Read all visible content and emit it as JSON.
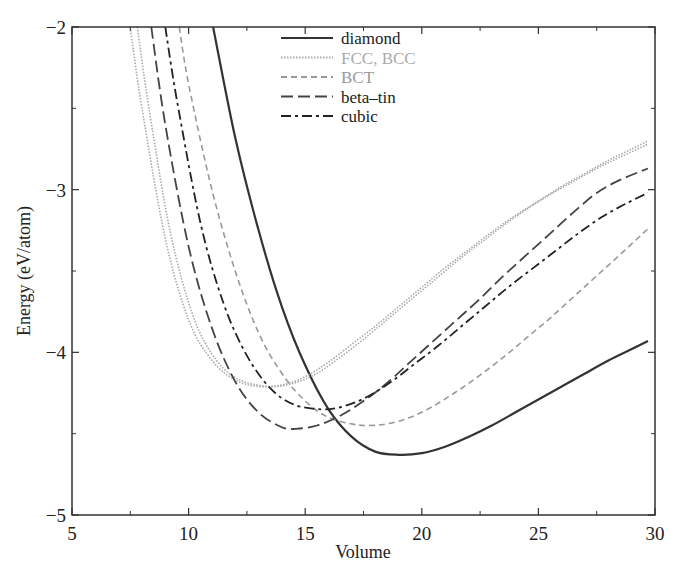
{
  "chart_data": {
    "type": "line",
    "title": "",
    "xlabel": "Volume",
    "ylabel": "Energy  (eV/atom)",
    "xlim": [
      5,
      30
    ],
    "ylim": [
      -5,
      -2
    ],
    "xticks": [
      5,
      10,
      15,
      20,
      25,
      30
    ],
    "yticks": [
      -5,
      -4,
      -3,
      -2
    ],
    "xtick_labels": [
      "5",
      "10",
      "15",
      "20",
      "25",
      "30"
    ],
    "ytick_labels": [
      "−5",
      "−4",
      "−3",
      "−2"
    ],
    "grid": false,
    "legend_position": "upper-center",
    "series": [
      {
        "name": "diamond",
        "legend_label": "diamond",
        "color": "#333333",
        "dash": "solid",
        "width": 2.2,
        "x": [
          11.05,
          12,
          13,
          14,
          15,
          16,
          17,
          18,
          19,
          20,
          21,
          22,
          23,
          24,
          25,
          26,
          27,
          28,
          29,
          29.7
        ],
        "y": [
          -2.0,
          -2.68,
          -3.25,
          -3.72,
          -4.08,
          -4.35,
          -4.52,
          -4.61,
          -4.63,
          -4.62,
          -4.58,
          -4.52,
          -4.45,
          -4.37,
          -4.29,
          -4.21,
          -4.13,
          -4.05,
          -3.98,
          -3.93
        ]
      },
      {
        "name": "FCC",
        "legend_label": "FCC, BCC",
        "color": "#aaaaaa",
        "dash": "dotted",
        "width": 1.6,
        "x": [
          7.5,
          8,
          9,
          10,
          11,
          12,
          13,
          14,
          15,
          16,
          17,
          18,
          19,
          20,
          21,
          22,
          23,
          24,
          25,
          26,
          27,
          28,
          29,
          29.7
        ],
        "y": [
          -2.0,
          -2.5,
          -3.3,
          -3.8,
          -4.05,
          -4.17,
          -4.21,
          -4.2,
          -4.15,
          -4.06,
          -3.95,
          -3.84,
          -3.72,
          -3.6,
          -3.48,
          -3.37,
          -3.26,
          -3.16,
          -3.07,
          -2.98,
          -2.9,
          -2.82,
          -2.75,
          -2.7
        ]
      },
      {
        "name": "BCC",
        "legend_label": "",
        "color": "#aaaaaa",
        "dash": "dotted",
        "width": 1.6,
        "x": [
          7.8,
          8.3,
          9.2,
          10.2,
          11.2,
          12.2,
          13.5,
          14.5,
          15.5,
          16.5,
          17.5,
          18.5,
          19.5,
          20.5,
          21.5,
          22.5,
          23.5,
          24.5,
          25.5,
          26.5,
          27.5,
          28.5,
          29.7
        ],
        "y": [
          -2.0,
          -2.5,
          -3.25,
          -3.78,
          -4.05,
          -4.17,
          -4.21,
          -4.19,
          -4.13,
          -4.03,
          -3.92,
          -3.8,
          -3.68,
          -3.56,
          -3.44,
          -3.33,
          -3.22,
          -3.12,
          -3.03,
          -2.95,
          -2.87,
          -2.8,
          -2.72
        ]
      },
      {
        "name": "BCT",
        "legend_label": "BCT",
        "color": "#999999",
        "dash": "dashed-short",
        "width": 1.6,
        "x": [
          9.6,
          10,
          11,
          12,
          13,
          14,
          15,
          16,
          17,
          17.7,
          18.5,
          19.5,
          20.5,
          21.5,
          22.5,
          23.5,
          24.5,
          25.5,
          26.5,
          27.5,
          28.5,
          29.7
        ],
        "y": [
          -2.0,
          -2.35,
          -3.0,
          -3.5,
          -3.88,
          -4.13,
          -4.3,
          -4.4,
          -4.44,
          -4.45,
          -4.44,
          -4.4,
          -4.33,
          -4.24,
          -4.14,
          -4.03,
          -3.91,
          -3.79,
          -3.66,
          -3.53,
          -3.4,
          -3.24
        ]
      },
      {
        "name": "beta-tin",
        "legend_label": "beta–tin",
        "color": "#444444",
        "dash": "dashed-long",
        "width": 1.8,
        "x": [
          8.4,
          9,
          10,
          11,
          12,
          13,
          14,
          14.6,
          15.5,
          16.5,
          17.5,
          18.5,
          19.5,
          20.5,
          21.5,
          22.5,
          23.5,
          24.5,
          25.5,
          26.5,
          27.5,
          28.5,
          29.7
        ],
        "y": [
          -2.0,
          -2.6,
          -3.35,
          -3.85,
          -4.18,
          -4.37,
          -4.46,
          -4.47,
          -4.45,
          -4.39,
          -4.3,
          -4.19,
          -4.06,
          -3.93,
          -3.8,
          -3.67,
          -3.53,
          -3.4,
          -3.27,
          -3.14,
          -3.02,
          -2.94,
          -2.87
        ]
      },
      {
        "name": "cubic",
        "legend_label": "cubic",
        "color": "#222222",
        "dash": "dash-dot",
        "width": 1.8,
        "x": [
          9,
          9.5,
          10.5,
          11.5,
          12.5,
          13.5,
          14.5,
          15.7,
          16.7,
          17.7,
          18.7,
          19.7,
          20.7,
          21.7,
          22.7,
          23.7,
          24.7,
          25.7,
          26.7,
          27.7,
          28.7,
          29.7
        ],
        "y": [
          -2.0,
          -2.45,
          -3.2,
          -3.7,
          -4.02,
          -4.22,
          -4.32,
          -4.35,
          -4.33,
          -4.27,
          -4.18,
          -4.07,
          -3.96,
          -3.84,
          -3.72,
          -3.6,
          -3.49,
          -3.38,
          -3.27,
          -3.17,
          -3.09,
          -3.02
        ]
      }
    ],
    "legend": [
      {
        "label": "diamond",
        "color": "#333333",
        "text_color": "#222222",
        "dash": "solid"
      },
      {
        "label": "FCC, BCC",
        "color": "#aaaaaa",
        "text_color": "#aaaaaa",
        "dash": "dotted"
      },
      {
        "label": "BCT",
        "color": "#999999",
        "text_color": "#999999",
        "dash": "dashed-short"
      },
      {
        "label": "beta–tin",
        "color": "#444444",
        "text_color": "#222222",
        "dash": "dashed-long"
      },
      {
        "label": "cubic",
        "color": "#222222",
        "text_color": "#222222",
        "dash": "dash-dot"
      }
    ]
  }
}
